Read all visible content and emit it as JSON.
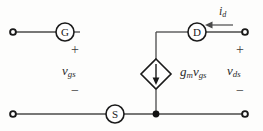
{
  "figure": {
    "type": "small-signal-equivalent-circuit",
    "background_color": "#fdfdfc",
    "line_color": "#3a3a3a",
    "text_color": "#2b2b2b"
  },
  "terminals": {
    "gate": {
      "letter": "G",
      "cx": 65,
      "cy": 32,
      "r": 9
    },
    "drain": {
      "letter": "D",
      "cx": 197,
      "cy": 32,
      "r": 9
    },
    "source": {
      "letter": "S",
      "cx": 115,
      "cy": 114,
      "r": 9
    }
  },
  "nodes": {
    "gate_terminal": {
      "x": 13,
      "y": 32,
      "style": "open"
    },
    "drain_terminal": {
      "x": 245,
      "y": 32,
      "style": "open"
    },
    "bottom_left_terminal": {
      "x": 13,
      "y": 114,
      "style": "open"
    },
    "bottom_right_terminal": {
      "x": 245,
      "y": 114,
      "style": "open"
    },
    "junction": {
      "x": 156,
      "y": 114,
      "style": "filled"
    }
  },
  "source_element": {
    "shape": "diamond",
    "cx": 156,
    "cy": 74,
    "half_width": 15,
    "half_height": 15,
    "arrow_direction": "down",
    "label": "g",
    "label_sub1": "m",
    "label_v": "v",
    "label_sub2": "gs"
  },
  "labels": {
    "gate_source_voltage": {
      "v": "v",
      "sub": "gs",
      "x": 63,
      "y": 66
    },
    "drain_source_voltage": {
      "v": "v",
      "sub": "ds",
      "x": 228,
      "y": 66
    },
    "drain_current": {
      "i": "i",
      "sub": "d",
      "x": 219,
      "y": 8
    }
  },
  "polarity": {
    "left_plus": {
      "text": "+",
      "x": 73,
      "y": 48
    },
    "left_minus": {
      "text": "−",
      "x": 73,
      "y": 88
    },
    "right_plus": {
      "text": "+",
      "x": 238,
      "y": 48
    },
    "right_minus": {
      "text": "−",
      "x": 238,
      "y": 88
    }
  },
  "current_arrow": {
    "from_x": 232,
    "to_x": 205,
    "y": 32,
    "direction": "left"
  },
  "wires": {
    "gate_branch": "from gate terminal through G circle (open right end)",
    "drain_branch": "from D circle right to drain terminal; left to x=156 then down to diamond top",
    "source_rail": "from bottom-left terminal through S circle to bottom-right terminal",
    "diamond_to_rail": "from diamond bottom down to junction on source rail"
  }
}
